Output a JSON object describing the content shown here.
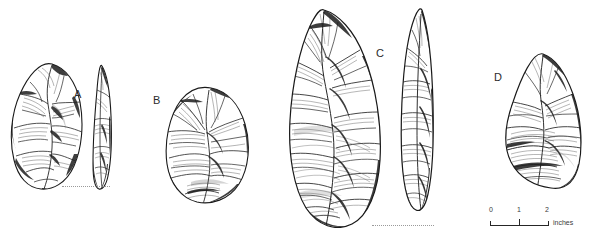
{
  "plate": {
    "title": "Acheulean handaxe illustration plate",
    "background_color": "#ffffff",
    "ink_color": "#1a1a1a",
    "width": 591,
    "height": 240
  },
  "figure_labels": [
    {
      "id": "A",
      "text": "A",
      "x": 74,
      "y": 89
    },
    {
      "id": "B",
      "text": "B",
      "x": 153,
      "y": 95
    },
    {
      "id": "C",
      "text": "C",
      "x": 376,
      "y": 48
    },
    {
      "id": "D",
      "text": "D",
      "x": 494,
      "y": 72
    }
  ],
  "artifacts": [
    {
      "id": "A",
      "name": "pointed-handaxe-a",
      "views": [
        "face",
        "profile"
      ],
      "caption_letter": "A",
      "has_baseline": true
    },
    {
      "id": "B",
      "name": "ovate-handaxe-b",
      "views": [
        "face"
      ],
      "caption_letter": "B",
      "has_baseline": false
    },
    {
      "id": "C",
      "name": "large-pointed-handaxe-c",
      "views": [
        "face",
        "profile"
      ],
      "caption_letter": "C",
      "has_baseline": true
    },
    {
      "id": "D",
      "name": "cleaver-handaxe-d",
      "views": [
        "face"
      ],
      "caption_letter": "D",
      "has_baseline": false
    }
  ],
  "scale_bar": {
    "unit_label": "inches",
    "ticks": [
      {
        "label": "0",
        "value": 0
      },
      {
        "label": "1",
        "value": 1
      },
      {
        "label": "2",
        "value": 2
      }
    ],
    "min": 0,
    "max": 2,
    "color": "#262626"
  }
}
